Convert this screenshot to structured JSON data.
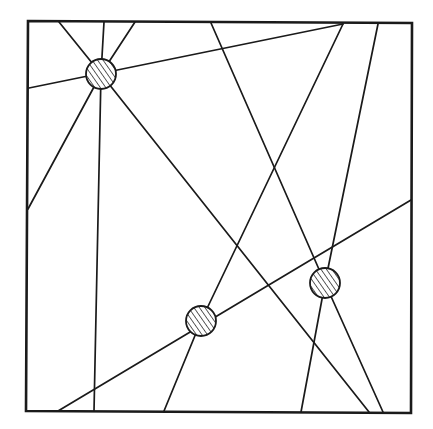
{
  "diagram": {
    "colors": {
      "stroke": "#1a1a1a",
      "background": "#ffffff",
      "circle_fill": "#ffffff"
    },
    "frame": {
      "points": [
        [
          28,
          21
        ],
        [
          412,
          23
        ],
        [
          411,
          413
        ],
        [
          26,
          411
        ]
      ],
      "stroke_width": 2.6
    },
    "circles": [
      {
        "id": "node-a",
        "cx": 101,
        "cy": 74,
        "r": 15
      },
      {
        "id": "node-b",
        "cx": 201,
        "cy": 321,
        "r": 15
      },
      {
        "id": "node-c",
        "cx": 325,
        "cy": 283,
        "r": 15
      }
    ],
    "lines": [
      {
        "x1": 59,
        "y1": 22,
        "x2": 101,
        "y2": 74
      },
      {
        "x1": 104,
        "y1": 22,
        "x2": 101,
        "y2": 74
      },
      {
        "x1": 135,
        "y1": 22,
        "x2": 101,
        "y2": 74
      },
      {
        "x1": 29,
        "y1": 88,
        "x2": 343,
        "y2": 24
      },
      {
        "x1": 28,
        "y1": 209,
        "x2": 101,
        "y2": 74
      },
      {
        "x1": 101,
        "y1": 74,
        "x2": 94,
        "y2": 411
      },
      {
        "x1": 101,
        "y1": 74,
        "x2": 369,
        "y2": 412
      },
      {
        "x1": 211,
        "y1": 23,
        "x2": 325,
        "y2": 283
      },
      {
        "x1": 378,
        "y1": 24,
        "x2": 325,
        "y2": 283
      },
      {
        "x1": 343,
        "y1": 24,
        "x2": 201,
        "y2": 321
      },
      {
        "x1": 58,
        "y1": 411,
        "x2": 411,
        "y2": 200
      },
      {
        "x1": 201,
        "y1": 321,
        "x2": 164,
        "y2": 411
      },
      {
        "x1": 325,
        "y1": 283,
        "x2": 301,
        "y2": 412
      },
      {
        "x1": 325,
        "y1": 283,
        "x2": 383,
        "y2": 412
      }
    ],
    "line_width": 1.7
  }
}
